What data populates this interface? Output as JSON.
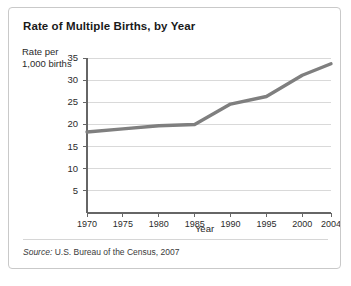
{
  "figure": {
    "title": "Rate of Multiple Births, by Year",
    "y_axis_caption_line1": "Rate per",
    "y_axis_caption_line2": "1,000 births",
    "source_prefix": "Source:",
    "source_text": "U.S. Bureau of the Census, 2007",
    "border_color": "#c9c9c9",
    "line_color": "#7f7f7f",
    "grid_color": "#d9d9d9",
    "axis_color": "#666666"
  },
  "chart_data": {
    "type": "line",
    "title": "Rate of Multiple Births, by Year",
    "xlabel": "Year",
    "ylabel": "Rate per 1,000 births",
    "x": [
      1970,
      1975,
      1980,
      1985,
      1990,
      1995,
      2000,
      2004
    ],
    "categories": [
      "1970",
      "1975",
      "1980",
      "1985",
      "1990",
      "1995",
      "2000",
      "2004"
    ],
    "values": [
      18.3,
      19.0,
      19.7,
      20.0,
      24.6,
      26.3,
      31.1,
      33.7
    ],
    "series": [
      {
        "name": "Rate of multiple births",
        "values": [
          18.3,
          19.0,
          19.7,
          20.0,
          24.6,
          26.3,
          31.1,
          33.7
        ]
      }
    ],
    "xlim": [
      1970,
      2004
    ],
    "ylim": [
      0,
      35
    ],
    "yticks": [
      35,
      30,
      25,
      20,
      15,
      10,
      5
    ],
    "ytick_labels": [
      "35",
      "30",
      "25",
      "20",
      "15",
      "10",
      "5"
    ],
    "xtick_labels": [
      "1970",
      "1975",
      "1980",
      "1985",
      "1990",
      "1995",
      "2000",
      "2004"
    ],
    "grid": "horizontal",
    "legend": "none",
    "annotations": []
  }
}
